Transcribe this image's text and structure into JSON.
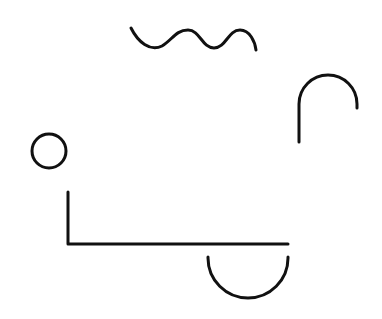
{
  "canvas": {
    "width": 382,
    "height": 319,
    "background": "#ffffff"
  },
  "style": {
    "stroke_color": "#111111",
    "stroke_width": 3
  },
  "shapes": [
    {
      "name": "wave-curve",
      "type": "wave",
      "start": [
        131,
        28
      ],
      "end": [
        256,
        50
      ],
      "cycles": 2.5
    },
    {
      "name": "arch-hook",
      "type": "arch",
      "line_x": 299,
      "line_bottom": 142,
      "arc_center": [
        328,
        104
      ],
      "arc_radius": 29,
      "right_end_y": 108
    },
    {
      "name": "small-circle",
      "type": "circle",
      "center": [
        49,
        151
      ],
      "radius": 17
    },
    {
      "name": "l-shape",
      "type": "polyline",
      "points": [
        [
          68,
          192
        ],
        [
          68,
          244
        ],
        [
          288,
          244
        ]
      ]
    },
    {
      "name": "bowl-semicircle",
      "type": "semicircle",
      "left_x": 208,
      "right_x": 288,
      "top_y": 257,
      "bottom_y": 298
    }
  ]
}
